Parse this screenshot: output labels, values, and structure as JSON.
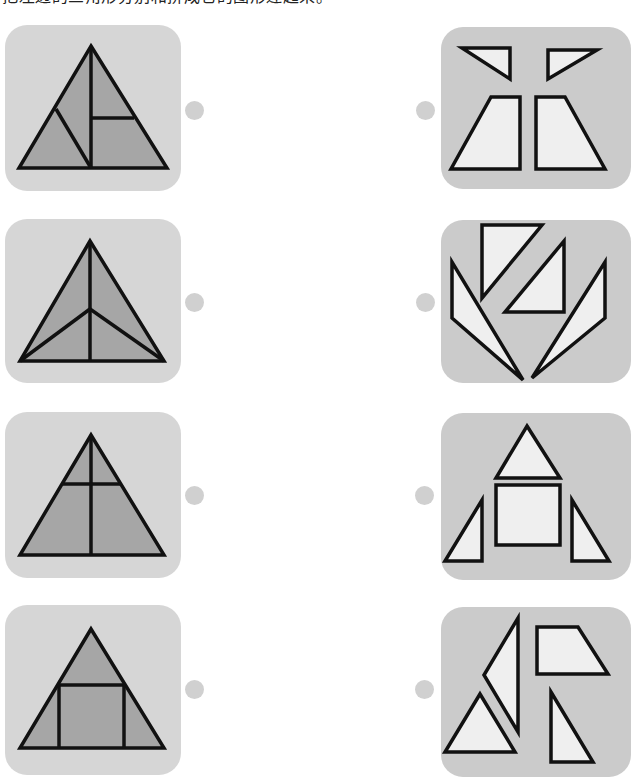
{
  "instruction": "把左边的三角形分别和拼成它的图形连起来。",
  "colors": {
    "left_card_bg": "#d6d6d6",
    "right_card_bg": "#cbcbcb",
    "left_fill": "#a6a6a6",
    "right_fill": "#efefef",
    "stroke": "#111111",
    "dot": "#d0d0d0"
  },
  "left_items": [
    {
      "id": "left-1",
      "description": "Triangle split into 4 pieces by vertical median, diagonal and horizontal segment",
      "card": {
        "x": 5,
        "y": 25,
        "w": 176,
        "h": 166
      },
      "dot": {
        "cx": 194,
        "cy": 110
      },
      "outline": "91,46 167,168 19,168",
      "lines": [
        [
          "91,46",
          "91,168"
        ],
        [
          "56,109",
          "91,168"
        ],
        [
          "91,118",
          "134,118"
        ]
      ]
    },
    {
      "id": "left-2",
      "description": "Triangle split into 4 pieces from an inner point",
      "card": {
        "x": 5,
        "y": 219,
        "w": 176,
        "h": 164
      },
      "dot": {
        "cx": 194,
        "cy": 302
      },
      "outline": "90,241 164,361 20,361",
      "lines": [
        [
          "90,241",
          "90,361"
        ],
        [
          "20,361",
          "90,309"
        ],
        [
          "164,361",
          "90,309"
        ]
      ]
    },
    {
      "id": "left-3",
      "description": "Triangle split into 4 pieces by a vertical and a horizontal line",
      "card": {
        "x": 5,
        "y": 412,
        "w": 176,
        "h": 166
      },
      "dot": {
        "cx": 194,
        "cy": 495
      },
      "outline": "91,435 164,555 20,555",
      "lines": [
        [
          "91,435",
          "91,555"
        ],
        [
          "63,484",
          "120,484"
        ]
      ]
    },
    {
      "id": "left-4",
      "description": "Triangle split into a square, top triangle and two side triangles",
      "card": {
        "x": 5,
        "y": 605,
        "w": 176,
        "h": 170
      },
      "dot": {
        "cx": 194,
        "cy": 689
      },
      "outline": "91,629 164,748 20,748",
      "lines": [
        [
          "59,685",
          "124,685"
        ],
        [
          "59,685",
          "59,748"
        ],
        [
          "124,685",
          "124,748"
        ]
      ]
    }
  ],
  "right_items": [
    {
      "id": "right-1",
      "description": "Two small right triangles above two trapezoids",
      "card": {
        "x": 441,
        "y": 27,
        "w": 190,
        "h": 162
      },
      "dot": {
        "cx": 425,
        "cy": 110
      },
      "pieces": [
        "462,48 510,48 510,79",
        "548,50 597,50 548,79",
        "491,97 520,97 520,169 451,169",
        "536,97 565,97 605,169 536,169"
      ]
    },
    {
      "id": "right-2",
      "description": "Two right triangles and two long narrow triangles",
      "card": {
        "x": 441,
        "y": 220,
        "w": 190,
        "h": 163
      },
      "dot": {
        "cx": 425,
        "cy": 302
      },
      "pieces": [
        "482,225 542,225 482,298",
        "564,241 564,312 505,312",
        "452,262 452,318 523,380",
        "605,262 605,318 532,378"
      ]
    },
    {
      "id": "right-3",
      "description": "Triangle, square and two right triangles",
      "card": {
        "x": 441,
        "y": 413,
        "w": 190,
        "h": 167
      },
      "dot": {
        "cx": 424,
        "cy": 495
      },
      "pieces": [
        "527,426 560,478 496,478",
        "496,485 560,485 560,545 496,545",
        "482,500 482,561 445,561",
        "572,500 609,561 572,561"
      ]
    },
    {
      "id": "right-4",
      "description": "Tall triangle, trapezoid and two triangles",
      "card": {
        "x": 441,
        "y": 607,
        "w": 190,
        "h": 170
      },
      "dot": {
        "cx": 424,
        "cy": 689
      },
      "pieces": [
        "518,618 518,732 484,675",
        "537,627 578,627 608,674 537,674",
        "480,694 515,752 445,752",
        "551,692 593,762 551,762"
      ]
    }
  ]
}
